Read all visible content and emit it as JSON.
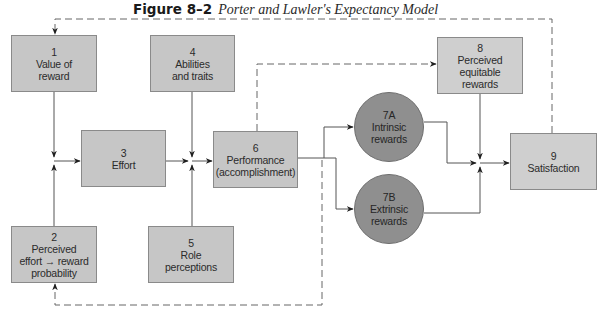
{
  "title": {
    "figure_label": "Figure 8–2",
    "caption": "Porter and Lawler's Expectancy Model"
  },
  "nodes": [
    {
      "id": "1",
      "number": "1",
      "lines": [
        "Value of",
        "reward"
      ]
    },
    {
      "id": "2",
      "number": "2",
      "lines": [
        "Perceived",
        "effort → reward",
        "probability"
      ]
    },
    {
      "id": "3",
      "number": "3",
      "lines": [
        "Effort"
      ]
    },
    {
      "id": "4",
      "number": "4",
      "lines": [
        "Abilities",
        "and traits"
      ]
    },
    {
      "id": "5",
      "number": "5",
      "lines": [
        "Role",
        "perceptions"
      ]
    },
    {
      "id": "6",
      "number": "6",
      "lines": [
        "Performance",
        "(accomplishment)"
      ]
    },
    {
      "id": "7A",
      "number": "7A",
      "lines": [
        "Intrinsic",
        "rewards"
      ]
    },
    {
      "id": "7B",
      "number": "7B",
      "lines": [
        "Extrinsic",
        "rewards"
      ]
    },
    {
      "id": "8",
      "number": "8",
      "lines": [
        "Perceived",
        "equitable",
        "rewards"
      ]
    },
    {
      "id": "9",
      "number": "9",
      "lines": [
        "Satisfaction"
      ]
    }
  ],
  "edges": [
    {
      "from": "1",
      "to": "3",
      "style": "solid"
    },
    {
      "from": "2",
      "to": "3",
      "style": "solid"
    },
    {
      "from": "3",
      "to": "6",
      "style": "solid"
    },
    {
      "from": "4",
      "to": "6",
      "style": "solid"
    },
    {
      "from": "5",
      "to": "6",
      "style": "solid"
    },
    {
      "from": "6",
      "to": "7A",
      "style": "solid"
    },
    {
      "from": "6",
      "to": "7B",
      "style": "solid"
    },
    {
      "from": "6",
      "to": "8",
      "style": "dashed"
    },
    {
      "from": "7A",
      "to": "9",
      "style": "solid"
    },
    {
      "from": "7B",
      "to": "9",
      "style": "solid"
    },
    {
      "from": "8",
      "to": "9",
      "style": "solid"
    },
    {
      "from": "9",
      "to": "1",
      "style": "dashed"
    },
    {
      "from": "6",
      "to": "2",
      "style": "dashed"
    }
  ],
  "colors": {
    "box_fill": "#c6c6c6",
    "circle_fill": "#8f8f8f",
    "line": "#555555",
    "text": "#2b2b2b"
  }
}
